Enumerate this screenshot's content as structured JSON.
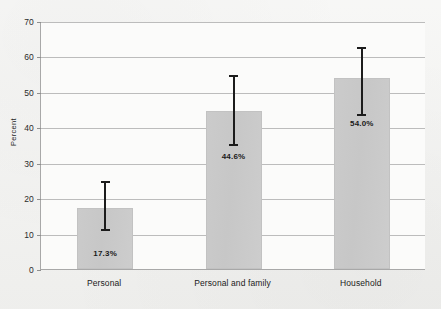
{
  "chart_data": {
    "type": "bar",
    "title": "",
    "xlabel": "",
    "ylabel": "Percent",
    "ylim": [
      0,
      70
    ],
    "ytick_step": 10,
    "ytick_labels": [
      "0",
      "10",
      "20",
      "30",
      "40",
      "50",
      "60",
      "70"
    ],
    "grid": true,
    "legend": false,
    "categories": [
      "Personal",
      "Personal and family",
      "Household"
    ],
    "values": [
      17.3,
      44.6,
      54.0
    ],
    "value_labels": [
      "17.3%",
      "44.6%",
      "54.0%"
    ],
    "error_bars": [
      {
        "lower": 11.0,
        "upper": 25.0
      },
      {
        "lower": 35.0,
        "upper": 55.0
      },
      {
        "lower": 43.5,
        "upper": 63.0
      }
    ],
    "colors": {
      "bar_fill": "#c9c9c9",
      "bar_edge": "#c2c2c2",
      "error_bar": "#1c1c1c",
      "gridline": "#bcbcbc",
      "axis": "#a8a8a8",
      "text": "#1a1a1a",
      "plot_background": "#fbfbfa",
      "figure_background": "#f3f3f1"
    }
  }
}
